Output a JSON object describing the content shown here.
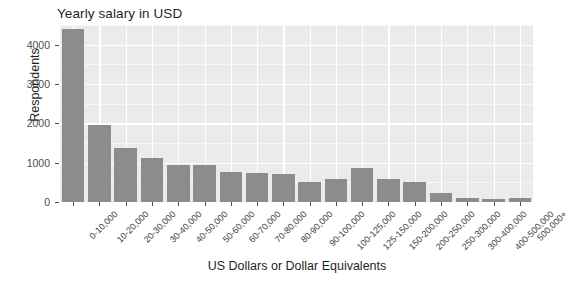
{
  "chart_data": {
    "type": "bar",
    "title": "Yearly salary in USD",
    "xlabel": "US Dollars or Dollar Equivalents",
    "ylabel": "Respondents",
    "ylim": [
      0,
      4500
    ],
    "yticks": [
      0,
      1000,
      2000,
      3000,
      4000
    ],
    "ytick_labels": [
      "0",
      "1000",
      "2000",
      "3000",
      "4000"
    ],
    "grid": true,
    "legend": "none",
    "bar_color": "#8c8c8c",
    "panel_color": "#ebebeb",
    "gridline_color": "#ffffff",
    "categories": [
      "0-10,000",
      "10-20,000",
      "20-30,000",
      "30-40,000",
      "40-50,000",
      "50-60,000",
      "60-70,000",
      "70-80,000",
      "80-90,000",
      "90-100,000",
      "100-125,000",
      "125-150,000",
      "150-200,000",
      "200-250,000",
      "250-300,000",
      "300-400,000",
      "400-500,000",
      "500,000+"
    ],
    "values": [
      4400,
      1950,
      1380,
      1110,
      950,
      940,
      760,
      740,
      700,
      510,
      590,
      870,
      580,
      500,
      220,
      90,
      80,
      100
    ]
  }
}
